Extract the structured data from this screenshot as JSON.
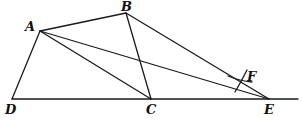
{
  "figure": {
    "type": "geometric-construction",
    "stroke_color": "#1a1a1a",
    "points": [
      {
        "id": "A",
        "label": "A",
        "x": 40,
        "y": 31,
        "lx": 25,
        "ly": 20
      },
      {
        "id": "B",
        "label": "B",
        "x": 126,
        "y": 13,
        "lx": 121,
        "ly": 0
      },
      {
        "id": "C",
        "label": "C",
        "x": 151,
        "y": 99,
        "lx": 146,
        "ly": 103
      },
      {
        "id": "D",
        "label": "D",
        "x": 12,
        "y": 99,
        "lx": 5,
        "ly": 103
      },
      {
        "id": "E",
        "label": "E",
        "x": 269,
        "y": 99,
        "lx": 264,
        "ly": 103
      },
      {
        "id": "F",
        "label": "F",
        "x": 241,
        "y": 80,
        "lx": 247,
        "ly": 70
      }
    ],
    "segments": [
      [
        "A",
        "B"
      ],
      [
        "A",
        "D"
      ],
      [
        "A",
        "C"
      ],
      [
        "A",
        "E"
      ],
      [
        "B",
        "C"
      ],
      [
        "B",
        "E"
      ],
      [
        "D",
        "E"
      ]
    ],
    "baseline_extension_to_x": 298,
    "arc_marks_at": "F"
  },
  "labels": {
    "A": "A",
    "B": "B",
    "C": "C",
    "D": "D",
    "E": "E",
    "F": "F"
  }
}
